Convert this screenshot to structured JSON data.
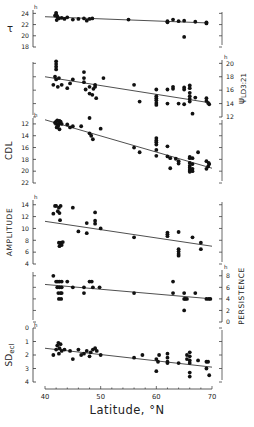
{
  "figure": {
    "xlabel": "Latitude, °N",
    "x_ticks": [
      40,
      50,
      60,
      70
    ]
  },
  "chart_data": [
    {
      "type": "scatter",
      "title": "",
      "ylabel": "τ",
      "yunit": "h",
      "axis_side": "left",
      "xlabel": "Latitude, °N",
      "xlim": [
        40,
        70
      ],
      "ylim": [
        18,
        24.6
      ],
      "y_ticks": [
        24,
        22,
        20,
        18
      ],
      "trend": {
        "x": [
          40,
          69
        ],
        "y": [
          23.4,
          22.3
        ]
      },
      "points": [
        [
          42,
          24.1
        ],
        [
          42,
          23.8
        ],
        [
          42.2,
          23.5
        ],
        [
          42.3,
          23.2
        ],
        [
          41.8,
          23.6
        ],
        [
          42.5,
          23.1
        ],
        [
          42.1,
          22.8
        ],
        [
          43,
          23.2
        ],
        [
          43.5,
          23.0
        ],
        [
          44,
          23.3
        ],
        [
          45,
          22.9
        ],
        [
          46,
          23.0
        ],
        [
          47,
          23.1
        ],
        [
          47.5,
          22.7
        ],
        [
          48,
          23.0
        ],
        [
          48.5,
          23.1
        ],
        [
          55,
          22.9
        ],
        [
          62,
          22.6
        ],
        [
          62,
          22.4
        ],
        [
          63,
          22.9
        ],
        [
          64,
          22.6
        ],
        [
          65,
          22.7
        ],
        [
          65,
          19.8
        ],
        [
          67,
          22.5
        ],
        [
          69,
          22.4
        ],
        [
          69,
          22.2
        ]
      ]
    },
    {
      "type": "scatter",
      "ylabel": "ψLD3:21",
      "yunit": "h",
      "axis_side": "right",
      "xlim": [
        40,
        70
      ],
      "ylim": [
        12,
        20.5
      ],
      "y_ticks": [
        20,
        18,
        16,
        14,
        12
      ],
      "trend": {
        "x": [
          40,
          69
        ],
        "y": [
          18.0,
          14.2
        ]
      },
      "points": [
        [
          42,
          20.3
        ],
        [
          42,
          19.9
        ],
        [
          42,
          19.5
        ],
        [
          42,
          19.1
        ],
        [
          41.8,
          18.0
        ],
        [
          42,
          17.6
        ],
        [
          41.5,
          16.8
        ],
        [
          42.3,
          16.5
        ],
        [
          42.5,
          17.8
        ],
        [
          43,
          16.8
        ],
        [
          44,
          16.3
        ],
        [
          44.5,
          17.0
        ],
        [
          45,
          17.6
        ],
        [
          47,
          18.7
        ],
        [
          47,
          17.8
        ],
        [
          47,
          17.2
        ],
        [
          47.3,
          16.1
        ],
        [
          48,
          16.5
        ],
        [
          48,
          15.5
        ],
        [
          48.5,
          15.3
        ],
        [
          48.7,
          16.2
        ],
        [
          49,
          16.8
        ],
        [
          49,
          16.5
        ],
        [
          49.2,
          14.8
        ],
        [
          50.5,
          17.8
        ],
        [
          56,
          16.8
        ],
        [
          57,
          14.3
        ],
        [
          60,
          16.1
        ],
        [
          60,
          15.1
        ],
        [
          60,
          14.8
        ],
        [
          60,
          14.5
        ],
        [
          60,
          14.1
        ],
        [
          60,
          13.8
        ],
        [
          62,
          16.1
        ],
        [
          62,
          14.0
        ],
        [
          63,
          16.5
        ],
        [
          63,
          16.2
        ],
        [
          64,
          14.0
        ],
        [
          65,
          16.4
        ],
        [
          65,
          16.1
        ],
        [
          65,
          13.9
        ],
        [
          66,
          16.7
        ],
        [
          66,
          16.3
        ],
        [
          66,
          15.6
        ],
        [
          66,
          15.1
        ],
        [
          66,
          14.7
        ],
        [
          66,
          14.3
        ],
        [
          66.5,
          12.5
        ],
        [
          67,
          14.9
        ],
        [
          69,
          14.8
        ],
        [
          69,
          14.4
        ],
        [
          69.3,
          14.1
        ],
        [
          69.5,
          13.9
        ]
      ]
    },
    {
      "type": "scatter",
      "ylabel": "CDL",
      "yunit": "h",
      "axis_side": "left",
      "inverted": true,
      "xlim": [
        40,
        70
      ],
      "ylim": [
        11,
        22
      ],
      "y_ticks": [
        12,
        14,
        16,
        18,
        20,
        22
      ],
      "trend": {
        "x": [
          40,
          70
        ],
        "y": [
          11.3,
          19.5
        ]
      },
      "points": [
        [
          41.8,
          11.8
        ],
        [
          42,
          11.6
        ],
        [
          42,
          12.0
        ],
        [
          42.2,
          11.4
        ],
        [
          42.4,
          12.2
        ],
        [
          42.5,
          11.9
        ],
        [
          42.6,
          11.5
        ],
        [
          42.8,
          11.6
        ],
        [
          43,
          12.0
        ],
        [
          42.3,
          12.4
        ],
        [
          42.1,
          12.6
        ],
        [
          42.6,
          12.9
        ],
        [
          44,
          12.1
        ],
        [
          44.5,
          12.6
        ],
        [
          45,
          12.4
        ],
        [
          46.5,
          12.4
        ],
        [
          48,
          11.0
        ],
        [
          48.3,
          14.0
        ],
        [
          48,
          13.6
        ],
        [
          48.6,
          14.6
        ],
        [
          50,
          12.8
        ],
        [
          56,
          16.0
        ],
        [
          57,
          16.8
        ],
        [
          60,
          14.4
        ],
        [
          60,
          14.8
        ],
        [
          60,
          15.1
        ],
        [
          60,
          15.5
        ],
        [
          60,
          16.4
        ],
        [
          60,
          17.4
        ],
        [
          62,
          15.8
        ],
        [
          62,
          17.5
        ],
        [
          62.5,
          17.8
        ],
        [
          62.5,
          19.5
        ],
        [
          63.5,
          17.9
        ],
        [
          64,
          18.3
        ],
        [
          64,
          18.7
        ],
        [
          66,
          17.6
        ],
        [
          66,
          17.8
        ],
        [
          66,
          18.6
        ],
        [
          66,
          19.1
        ],
        [
          66,
          19.4
        ],
        [
          66,
          19.8
        ],
        [
          66,
          20.1
        ],
        [
          66.5,
          17.8
        ],
        [
          66.5,
          18.8
        ],
        [
          66.5,
          19.6
        ],
        [
          66.5,
          20.0
        ],
        [
          67.5,
          16.8
        ],
        [
          69,
          18.3
        ],
        [
          69.5,
          18.8
        ],
        [
          69.3,
          19.2
        ],
        [
          69,
          19.6
        ],
        [
          69.4,
          18.6
        ]
      ]
    },
    {
      "type": "scatter",
      "ylabel": "AMPLITUDE",
      "yunit": "h",
      "axis_side": "left",
      "xlim": [
        40,
        70
      ],
      "ylim": [
        4,
        14.8
      ],
      "y_ticks": [
        14,
        12,
        10,
        8,
        6,
        4
      ],
      "trend": {
        "x": [
          40,
          70
        ],
        "y": [
          11.2,
          7.0
        ]
      },
      "points": [
        [
          41.5,
          12.5
        ],
        [
          41.8,
          13.8
        ],
        [
          42,
          13.8
        ],
        [
          42.3,
          12.9
        ],
        [
          42.5,
          13.5
        ],
        [
          42.6,
          12.6
        ],
        [
          42.8,
          13.8
        ],
        [
          42.7,
          11.4
        ],
        [
          42.5,
          7.6
        ],
        [
          42.8,
          7.3
        ],
        [
          42.6,
          7.0
        ],
        [
          42.9,
          7.6
        ],
        [
          43,
          7.2
        ],
        [
          43.2,
          7.7
        ],
        [
          45,
          13.5
        ],
        [
          46,
          9.5
        ],
        [
          47.5,
          9.2
        ],
        [
          47.5,
          10.9
        ],
        [
          49,
          12.7
        ],
        [
          49,
          11.3
        ],
        [
          49,
          10.8
        ],
        [
          50,
          10.0
        ],
        [
          56,
          8.5
        ],
        [
          62,
          9.3
        ],
        [
          62,
          9.0
        ],
        [
          62,
          8.7
        ],
        [
          64,
          9.4
        ],
        [
          64,
          6.5
        ],
        [
          64,
          6.1
        ],
        [
          64,
          5.7
        ],
        [
          64,
          5.4
        ],
        [
          66.5,
          8.5
        ],
        [
          68,
          7.6
        ],
        [
          68,
          6.5
        ]
      ]
    },
    {
      "type": "scatter",
      "ylabel": "PERSISTENCE",
      "yunit": "h",
      "axis_side": "right",
      "xlim": [
        40,
        70
      ],
      "ylim": [
        0,
        9
      ],
      "y_ticks": [
        8,
        6,
        4,
        2,
        0
      ],
      "trend": {
        "x": [
          40,
          70
        ],
        "y": [
          6.5,
          4.0
        ]
      },
      "points": [
        [
          41.5,
          8
        ],
        [
          42,
          7
        ],
        [
          42.3,
          7
        ],
        [
          42.6,
          7
        ],
        [
          43,
          7
        ],
        [
          42.2,
          6
        ],
        [
          42.6,
          6
        ],
        [
          43,
          6
        ],
        [
          42.4,
          5
        ],
        [
          42.8,
          5
        ],
        [
          43,
          5
        ],
        [
          42.5,
          4
        ],
        [
          42.9,
          4
        ],
        [
          44,
          7
        ],
        [
          45,
          6
        ],
        [
          47,
          6
        ],
        [
          47,
          5
        ],
        [
          48,
          7
        ],
        [
          48.4,
          7
        ],
        [
          48.6,
          6
        ],
        [
          49.8,
          6
        ],
        [
          56,
          5
        ],
        [
          63,
          7
        ],
        [
          63,
          5
        ],
        [
          65,
          5
        ],
        [
          65.2,
          4
        ],
        [
          65,
          4
        ],
        [
          65.5,
          4
        ],
        [
          65,
          2
        ],
        [
          67,
          5
        ],
        [
          69,
          4
        ],
        [
          69.4,
          4
        ],
        [
          69.7,
          4
        ]
      ]
    },
    {
      "type": "scatter",
      "ylabel": "SDecl",
      "yunit": "h",
      "axis_side": "left",
      "inverted": true,
      "xlim": [
        40,
        70
      ],
      "ylim": [
        0,
        4
      ],
      "y_ticks": [
        0,
        1,
        2,
        3,
        4
      ],
      "trend": {
        "x": [
          40,
          70
        ],
        "y": [
          1.5,
          2.9
        ]
      },
      "points": [
        [
          41.5,
          2.0
        ],
        [
          42,
          1.6
        ],
        [
          42.2,
          1.3
        ],
        [
          42.4,
          1.1
        ],
        [
          42.6,
          1.5
        ],
        [
          42.8,
          1.2
        ],
        [
          42.5,
          1.9
        ],
        [
          43,
          1.7
        ],
        [
          43.5,
          1.6
        ],
        [
          44.5,
          1.7
        ],
        [
          45,
          2.3
        ],
        [
          46,
          1.6
        ],
        [
          46.5,
          2.0
        ],
        [
          47,
          1.9
        ],
        [
          47.5,
          1.7
        ],
        [
          48,
          2.1
        ],
        [
          48.2,
          1.8
        ],
        [
          48.6,
          1.6
        ],
        [
          49,
          1.5
        ],
        [
          49.3,
          1.7
        ],
        [
          50,
          2.0
        ],
        [
          56,
          2.2
        ],
        [
          57.5,
          2.0
        ],
        [
          60,
          2.3
        ],
        [
          60.3,
          2.5
        ],
        [
          60,
          3.2
        ],
        [
          60.5,
          2.0
        ],
        [
          62,
          1.9
        ],
        [
          62,
          2.2
        ],
        [
          62,
          2.5
        ],
        [
          62,
          2.6
        ],
        [
          64,
          2.6
        ],
        [
          65.5,
          2.0
        ],
        [
          65.5,
          2.3
        ],
        [
          66,
          1.8
        ],
        [
          66,
          2.1
        ],
        [
          66,
          2.4
        ],
        [
          66,
          2.6
        ],
        [
          66,
          3.3
        ],
        [
          66,
          3.6
        ],
        [
          67.5,
          2.4
        ],
        [
          69,
          2.5
        ],
        [
          69.3,
          2.5
        ],
        [
          69,
          3.0
        ],
        [
          69.5,
          3.5
        ]
      ]
    }
  ]
}
